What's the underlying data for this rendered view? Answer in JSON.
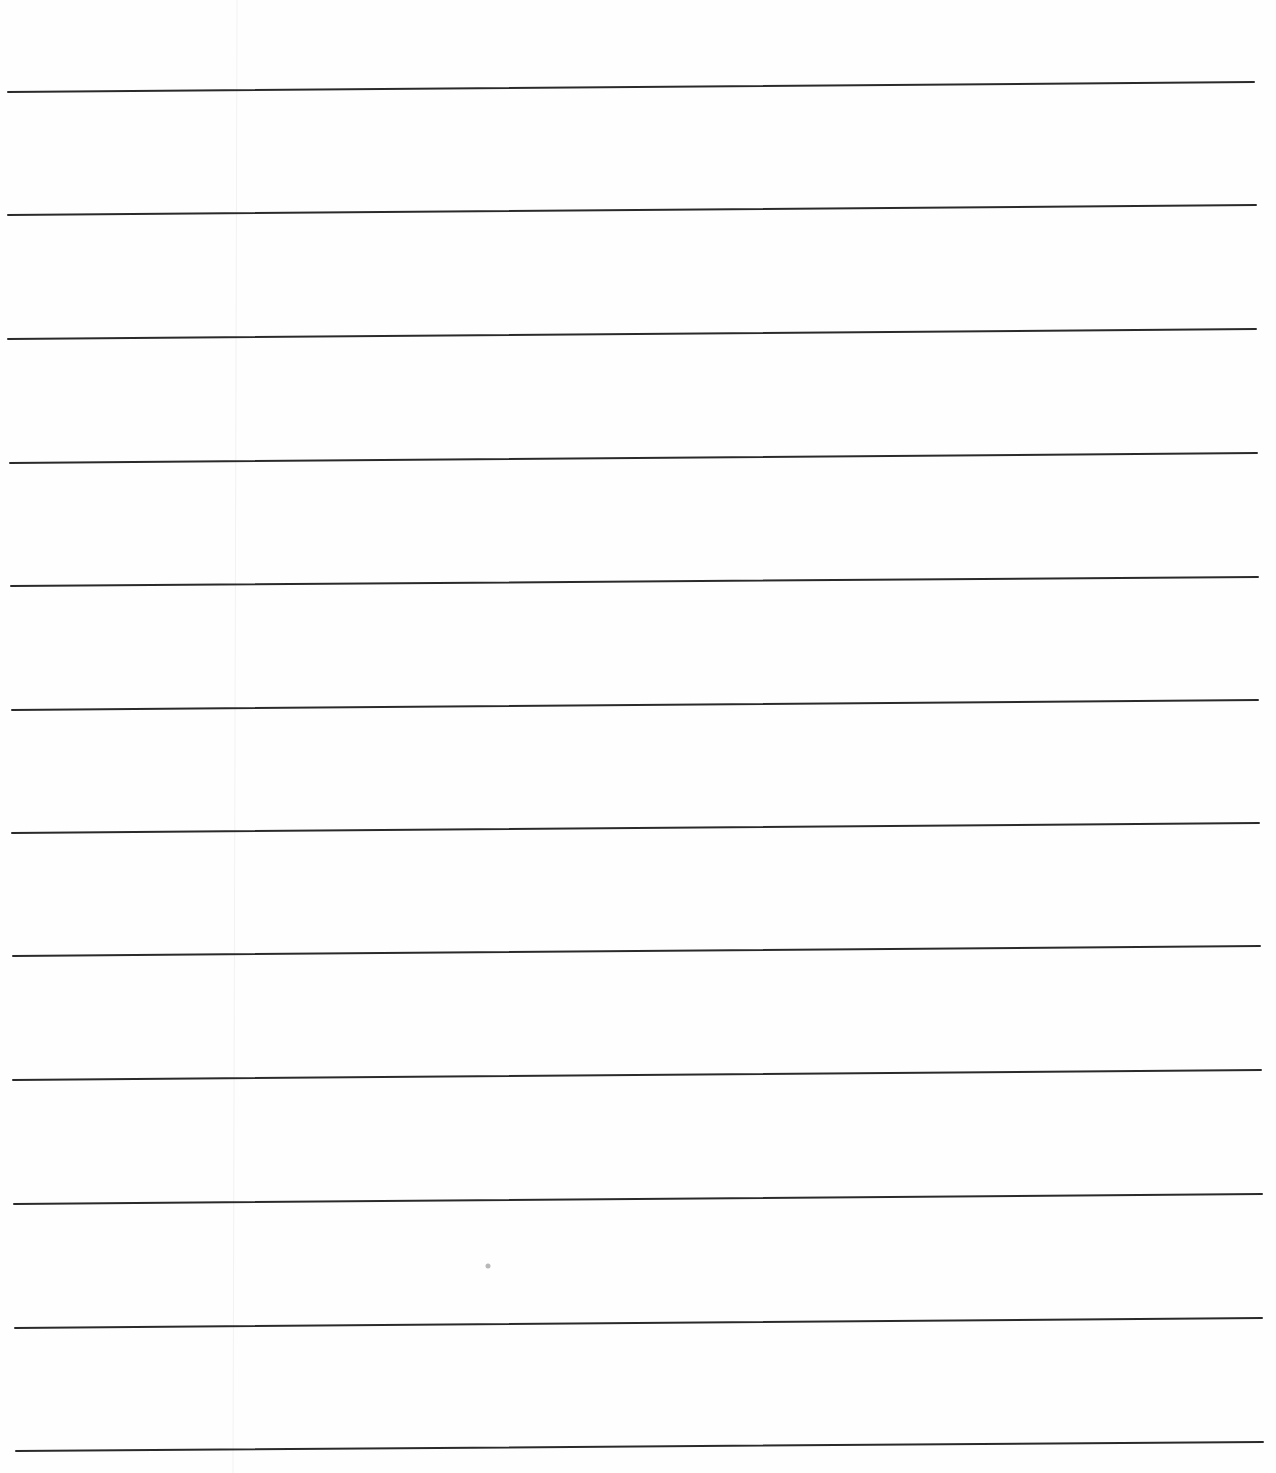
{
  "document": {
    "type": "lined-paper",
    "text": "",
    "line_color": "#2a2a2a",
    "line_width": 2,
    "lines": [
      {
        "x1": 8,
        "y1": 92,
        "x2": 1254,
        "y2": 82
      },
      {
        "x1": 8,
        "y1": 215,
        "x2": 1256,
        "y2": 205
      },
      {
        "x1": 8,
        "y1": 339,
        "x2": 1256,
        "y2": 329
      },
      {
        "x1": 10,
        "y1": 463,
        "x2": 1257,
        "y2": 453
      },
      {
        "x1": 11,
        "y1": 586,
        "x2": 1258,
        "y2": 577
      },
      {
        "x1": 12,
        "y1": 710,
        "x2": 1258,
        "y2": 700
      },
      {
        "x1": 12,
        "y1": 833,
        "x2": 1259,
        "y2": 823
      },
      {
        "x1": 13,
        "y1": 956,
        "x2": 1260,
        "y2": 946
      },
      {
        "x1": 13,
        "y1": 1080,
        "x2": 1261,
        "y2": 1070
      },
      {
        "x1": 14,
        "y1": 1204,
        "x2": 1262,
        "y2": 1194
      },
      {
        "x1": 15,
        "y1": 1328,
        "x2": 1262,
        "y2": 1318
      },
      {
        "x1": 16,
        "y1": 1451,
        "x2": 1263,
        "y2": 1442
      }
    ],
    "faint_vertical_line": {
      "x": 237,
      "color": "#f2f2f2"
    },
    "speck": {
      "x": 488,
      "y": 1266,
      "color": "#b8b8b8"
    }
  }
}
